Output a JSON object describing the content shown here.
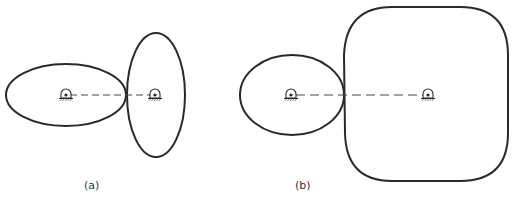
{
  "figure": {
    "panels": [
      {
        "id": "a",
        "label": "(a)",
        "shapes": [
          {
            "kind": "ellipse",
            "name": "driver-ellipse",
            "cx": 66,
            "cy": 95,
            "rx": 60,
            "ry": 31
          },
          {
            "kind": "ellipse",
            "name": "follower-ellipse",
            "cx": 156,
            "cy": 95,
            "rx": 29,
            "ry": 62
          }
        ],
        "pivots": [
          {
            "x": 66,
            "y": 95
          },
          {
            "x": 155,
            "y": 95
          }
        ],
        "center_line": {
          "x1": 66,
          "y1": 95,
          "x2": 155,
          "y2": 95
        }
      },
      {
        "id": "b",
        "label": "(b)",
        "shapes": [
          {
            "kind": "ellipse",
            "name": "driver-ellipse",
            "cx": 292,
            "cy": 95,
            "rx": 52,
            "ry": 40
          },
          {
            "kind": "rounded-square",
            "name": "follower-rounded-square",
            "x": 344,
            "y": 7,
            "w": 164,
            "h": 174
          }
        ],
        "pivots": [
          {
            "x": 291,
            "y": 95
          },
          {
            "x": 428,
            "y": 95
          }
        ],
        "center_line": {
          "x1": 291,
          "y1": 95,
          "x2": 428,
          "y2": 95
        }
      }
    ],
    "stroke_color": "#2a2a2a"
  }
}
